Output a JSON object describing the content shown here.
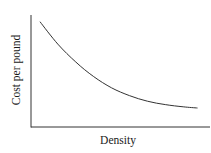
{
  "chart_data": {
    "type": "line",
    "title": "",
    "xlabel": "Density",
    "ylabel": "Cost per pound",
    "x_ticks": [],
    "y_ticks": [],
    "grid": false,
    "legend": null,
    "series": [
      {
        "name": "Cost per pound vs Density",
        "description": "Monotonically decreasing convex curve (diminishing cost per pound as density increases), leveling off toward the right",
        "x": [
          0.05,
          0.15,
          0.25,
          0.35,
          0.45,
          0.55,
          0.65,
          0.75,
          0.85,
          0.93
        ],
        "y": [
          0.94,
          0.74,
          0.58,
          0.45,
          0.35,
          0.28,
          0.23,
          0.2,
          0.18,
          0.17
        ]
      }
    ],
    "xlim": [
      0,
      1
    ],
    "ylim": [
      0,
      1
    ],
    "color": "#333333"
  }
}
